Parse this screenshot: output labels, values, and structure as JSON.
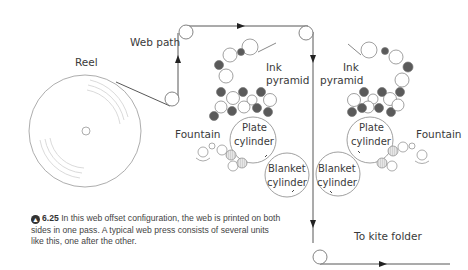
{
  "diagram": {
    "labels": {
      "reel": "Reel",
      "web_path": "Web path",
      "ink_pyramid_left_1": "Ink",
      "ink_pyramid_left_2": "pyramid",
      "ink_pyramid_right_1": "Ink",
      "ink_pyramid_right_2": "pyramid",
      "fountain_left": "Fountain",
      "fountain_right": "Fountain",
      "plate_left_1": "Plate",
      "plate_left_2": "cylinder",
      "plate_right_1": "Plate",
      "plate_right_2": "cylinder",
      "blanket_left_1": "Blanket",
      "blanket_left_2": "cylinder",
      "blanket_right_1": "Blanket",
      "blanket_right_2": "cylinder",
      "to_kite_folder": "To kite folder"
    },
    "colors": {
      "line": "#555555",
      "roller_dark": "#5a5a5a",
      "roller_light": "#ffffff",
      "roller_hatched": "#cfcfcf",
      "reel_rings": "#cccccc"
    }
  },
  "caption": {
    "icon": "arrow-up-circle-icon",
    "figure_number": "6.25",
    "text": "In this web offset configuration, the web is printed on both sides in one pass. A typical web press consists of several units like this, one after the other."
  }
}
